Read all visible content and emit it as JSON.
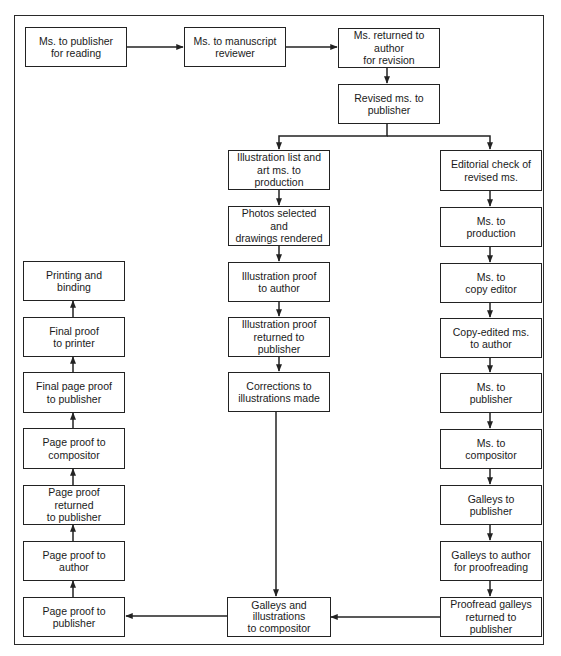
{
  "diagram": {
    "type": "flowchart",
    "title": "",
    "top_row": [
      {
        "id": "ms_to_publisher",
        "label": "Ms. to publisher\nfor reading"
      },
      {
        "id": "ms_to_reviewer",
        "label": "Ms. to manuscript\nreviewer"
      },
      {
        "id": "ms_returned_author",
        "label": "Ms. returned to author\nfor revision"
      },
      {
        "id": "revised_ms",
        "label": "Revised ms. to\npublisher"
      }
    ],
    "illustration_column": [
      {
        "id": "illus_list",
        "label": "Illustration list and\nart ms. to production"
      },
      {
        "id": "photos_selected",
        "label": "Photos selected and\ndrawings rendered"
      },
      {
        "id": "illus_proof_author",
        "label": "Illustration proof\nto author"
      },
      {
        "id": "illus_proof_returned",
        "label": "Illustration proof\nreturned to publisher"
      },
      {
        "id": "corrections",
        "label": "Corrections to\nillustrations made"
      }
    ],
    "editorial_column": [
      {
        "id": "editorial_check",
        "label": "Editorial check of\nrevised ms."
      },
      {
        "id": "ms_to_production",
        "label": "Ms. to\nproduction"
      },
      {
        "id": "ms_to_copy_editor",
        "label": "Ms. to\ncopy editor"
      },
      {
        "id": "copy_edited",
        "label": "Copy-edited ms.\nto author"
      },
      {
        "id": "ms_to_publisher_2",
        "label": "Ms. to\npublisher"
      },
      {
        "id": "ms_to_compositor",
        "label": "Ms. to\ncompositor"
      },
      {
        "id": "galleys_to_publisher",
        "label": "Galleys to\npublisher"
      },
      {
        "id": "galleys_to_author",
        "label": "Galleys to author\nfor proofreading"
      },
      {
        "id": "proofread_galleys",
        "label": "Proofread galleys\nreturned to publisher"
      }
    ],
    "merge_node": {
      "id": "galleys_illus_compositor",
      "label": "Galleys and\nillustrations\nto compositor"
    },
    "page_proof_column": [
      {
        "id": "printing",
        "label": "Printing and\nbinding"
      },
      {
        "id": "final_proof_printer",
        "label": "Final proof\nto printer"
      },
      {
        "id": "final_page_proof",
        "label": "Final page proof\nto publisher"
      },
      {
        "id": "page_proof_compositor",
        "label": "Page proof to\ncompositor"
      },
      {
        "id": "page_proof_returned",
        "label": "Page proof returned\nto publisher"
      },
      {
        "id": "page_proof_author",
        "label": "Page proof to\nauthor"
      },
      {
        "id": "page_proof_publisher",
        "label": "Page proof to\npublisher"
      }
    ],
    "colors": {
      "line": "#222222",
      "background": "#ffffff"
    }
  }
}
